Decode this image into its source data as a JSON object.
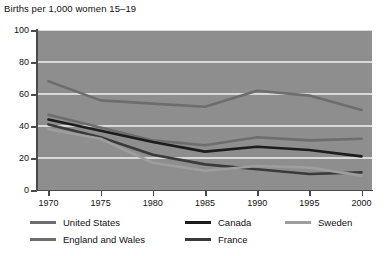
{
  "chart_data": {
    "type": "line",
    "title": "Births per 1,000 women 15–19",
    "xlabel": "",
    "ylabel": "",
    "x": [
      1970,
      1975,
      1980,
      1985,
      1990,
      1995,
      2000
    ],
    "xlim": [
      1969,
      2001
    ],
    "ylim": [
      0,
      100
    ],
    "yticks": [
      0,
      20,
      40,
      60,
      80,
      100
    ],
    "xticks": [
      1970,
      1975,
      1980,
      1985,
      1990,
      1995,
      2000
    ],
    "grid": "horizontal-white",
    "legend_position": "below",
    "plot_background": "#8e8e8e",
    "series": [
      {
        "name": "United States",
        "color": "#6d6d6d",
        "values": [
          68,
          56,
          54,
          52,
          62,
          59,
          50
        ]
      },
      {
        "name": "England and Wales",
        "color": "#6d6d6d",
        "values": [
          47,
          39,
          31,
          28,
          33,
          31,
          32
        ]
      },
      {
        "name": "Canada",
        "color": "#1c1c1c",
        "values": [
          44,
          37,
          30,
          24,
          27,
          25,
          21
        ]
      },
      {
        "name": "France",
        "color": "#3a3a3a",
        "values": [
          41,
          33,
          22,
          16,
          13,
          10,
          11
        ]
      },
      {
        "name": "Sweden",
        "color": "#9e9e9e",
        "values": [
          38,
          32,
          17,
          12,
          15,
          14,
          9
        ]
      }
    ]
  },
  "axis": {
    "y_labels": [
      "100",
      "80",
      "60",
      "40",
      "20",
      "0"
    ],
    "x_labels": [
      "1970",
      "1975",
      "1980",
      "1985",
      "1990",
      "1995",
      "2000"
    ]
  },
  "legend": {
    "items": [
      {
        "label": "United States",
        "color": "#6d6d6d"
      },
      {
        "label": "Canada",
        "color": "#1c1c1c"
      },
      {
        "label": "Sweden",
        "color": "#9e9e9e"
      },
      {
        "label": "England and Wales",
        "color": "#6d6d6d"
      },
      {
        "label": "France",
        "color": "#3a3a3a"
      }
    ]
  }
}
